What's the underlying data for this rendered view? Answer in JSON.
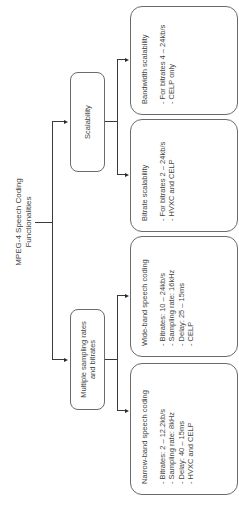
{
  "title": {
    "line1": "MPEG-4 Speech Coding",
    "line2": "Functionalities"
  },
  "categories": [
    {
      "id": "scalability",
      "label": "Scalability",
      "children": [
        {
          "id": "bandwidth-scalability",
          "heading": "Bandwidth scalability",
          "items": [
            "For bitrates 4 – 24kb/s",
            "CELP only"
          ]
        },
        {
          "id": "bitrate-scalability",
          "heading": "Bitrate scalability",
          "items": [
            "For bitrates 2 – 24kb/s",
            "HVXC and CELP"
          ]
        }
      ]
    },
    {
      "id": "multiple-sampling",
      "label_line1": "Multiple sampling rates",
      "label_line2": "and bitrates",
      "children": [
        {
          "id": "wide-band",
          "heading": "Wide-band speech coding",
          "items": [
            "Bitrates: 10 – 24kb/s",
            "Sampling rate: 16kHz",
            "Delay: 25 – 15ms",
            "CELP"
          ]
        },
        {
          "id": "narrow-band",
          "heading": "Narrow-band speech coding",
          "items": [
            "Bitrates: 2 – 12.2kb/s",
            "Sampling rate: 8kHz",
            "Delay: 40 – 15ms",
            "HVXC and CELP"
          ]
        }
      ]
    }
  ],
  "colors": {
    "line": "#3a3a3a",
    "box_border": "#6a6a6a",
    "text": "#444444",
    "background": "#ffffff"
  }
}
